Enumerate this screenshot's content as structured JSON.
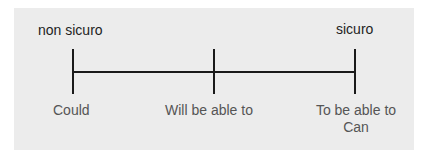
{
  "scale": {
    "left_label": "non sicuro",
    "right_label": "sicuro",
    "points": [
      {
        "label": "Could"
      },
      {
        "label": "Will be able to"
      },
      {
        "label_line1": "To be able to",
        "label_line2": "Can"
      }
    ]
  },
  "colors": {
    "background": "#ececec",
    "line": "#1a1a1a",
    "top_text": "#1e1e1e",
    "bottom_text": "#555555"
  }
}
